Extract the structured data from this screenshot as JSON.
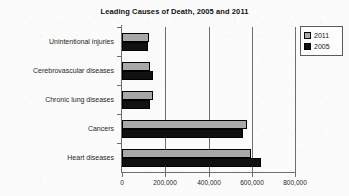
{
  "chart_data": {
    "type": "bar",
    "orientation": "horizontal",
    "title": "Leading Causes of Death, 2005 and 2011",
    "xlabel": "",
    "ylabel": "",
    "xlim": [
      0,
      800000
    ],
    "xticks": [
      0,
      200000,
      400000,
      600000,
      800000
    ],
    "xtick_labels": [
      "0",
      "200,000",
      "400,000",
      "600,000",
      "800,000"
    ],
    "grid": true,
    "grid_axis": "x",
    "legend_position": "top-right",
    "categories": [
      "Unintentional injuries",
      "Cerebrovascular diseases",
      "Chronic lung diseases",
      "Cancers",
      "Heart diseases"
    ],
    "series": [
      {
        "name": "2011",
        "color": "#a8a8a8",
        "values": [
          126000,
          128000,
          143000,
          576000,
          597000
        ]
      },
      {
        "name": "2005",
        "color": "#111111",
        "values": [
          118000,
          144000,
          131000,
          559000,
          645000
        ]
      }
    ]
  },
  "legend": {
    "items": [
      {
        "label": "2011",
        "swatch": "gray-swatch-icon"
      },
      {
        "label": "2005",
        "swatch": "black-swatch-icon"
      }
    ]
  }
}
